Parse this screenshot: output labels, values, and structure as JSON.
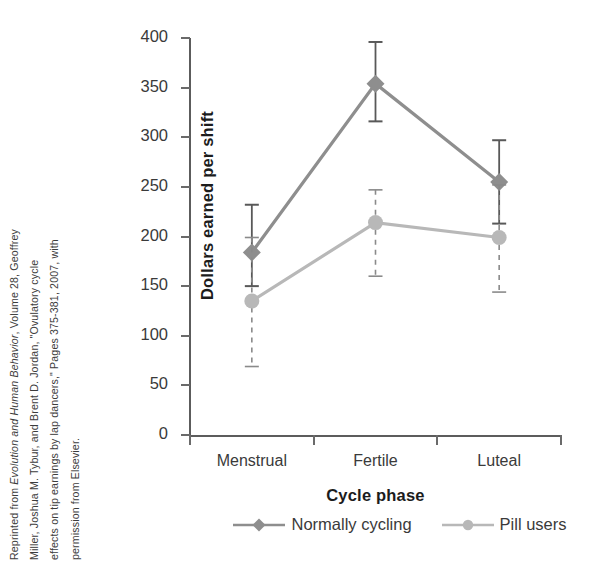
{
  "attribution": {
    "lines": [
      "Reprinted from <i>Evolution and Human Behavior</i>, Volume 28, Geoffrey",
      "Miller, Joshua M. Tybur, and Brent D. Jordan, \"Ovulatory cycle",
      "effects on tip earnings by lap dancers,\" Pages 375-381, 2007, with",
      "permission from Elsevier."
    ]
  },
  "chart_data": {
    "type": "line",
    "title": "",
    "xlabel": "Cycle phase",
    "ylabel": "Dollars earned per shift",
    "categories": [
      "Menstrual",
      "Fertile",
      "Luteal"
    ],
    "ylim": [
      0,
      400
    ],
    "yticks": [
      0,
      50,
      100,
      150,
      200,
      250,
      300,
      350,
      400
    ],
    "ytick_labels": [
      "0",
      "50",
      "100",
      "150",
      "200",
      "250",
      "300",
      "350",
      "400"
    ],
    "grid": false,
    "legend_position": "bottom",
    "series": [
      {
        "name": "Normally cycling",
        "marker": "diamond",
        "color": "#8e8e8e",
        "linestyle": "solid",
        "errorbar_style": "solid",
        "values": [
          184,
          354,
          255
        ],
        "err_low": [
          150,
          316,
          213
        ],
        "err_high": [
          232,
          396,
          297
        ]
      },
      {
        "name": "Pill users",
        "marker": "circle",
        "color": "#b8b8b8",
        "linestyle": "solid",
        "errorbar_style": "dashed",
        "values": [
          135,
          214,
          199
        ],
        "err_low": [
          69,
          160,
          144
        ],
        "err_high": [
          199,
          247,
          252
        ]
      }
    ]
  },
  "colors": {
    "axis": "#5c5c5c",
    "text": "#3a3a3a",
    "title_text": "#1c1c1c",
    "series_normally_cycling": "#8e8e8e",
    "series_pill_users": "#b8b8b8",
    "errorbar_dark": "#595959",
    "errorbar_light": "#8a8a8a"
  }
}
